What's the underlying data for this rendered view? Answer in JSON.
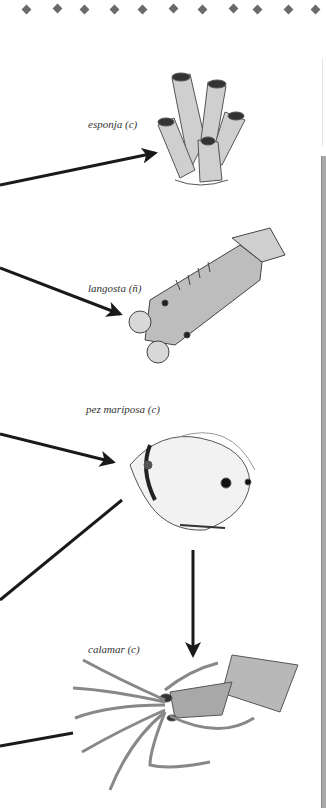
{
  "diagram": {
    "type": "food-web-fragment",
    "organisms": [
      {
        "id": "sponge",
        "label": "esponja (c)",
        "icon": "sponge-illustration"
      },
      {
        "id": "lobster",
        "label": "langosta (ñ)",
        "icon": "lobster-illustration"
      },
      {
        "id": "butterflyfish",
        "label": "pez mariposa (c)",
        "icon": "butterflyfish-illustration"
      },
      {
        "id": "squid",
        "label": "calamar (c)",
        "icon": "squid-illustration"
      }
    ],
    "arrows": [
      {
        "from": "offscreen-left",
        "to": "sponge"
      },
      {
        "from": "offscreen-left",
        "to": "lobster"
      },
      {
        "from": "offscreen-left",
        "to": "butterflyfish"
      },
      {
        "from": "butterflyfish",
        "to": "offscreen-left"
      },
      {
        "from": "butterflyfish",
        "to": "squid"
      },
      {
        "from": "squid",
        "to": "offscreen-left"
      }
    ]
  },
  "colors": {
    "arrow": "#1a1a1a",
    "dot_border": "#6a6a6a",
    "edge_bar": "#a9a9a9"
  }
}
